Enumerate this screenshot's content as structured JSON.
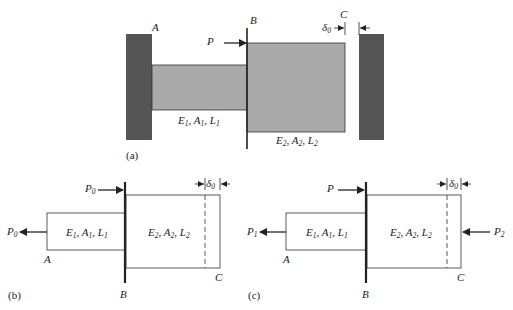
{
  "colors": {
    "wall": "#555555",
    "bar_fill": "#aaaaaa",
    "line": "#222222",
    "background": "#ffffff"
  },
  "panel_a": {
    "label": "(a)",
    "point_A": "A",
    "point_B": "B",
    "point_C": "C",
    "load": "P",
    "gap": "δ",
    "gap_sub": "0",
    "segment1": {
      "E": "E",
      "A": "A",
      "L": "L",
      "sub": "1"
    },
    "segment2": {
      "E": "E",
      "A": "A",
      "L": "L",
      "sub": "2"
    }
  },
  "panel_b": {
    "label": "(b)",
    "point_A": "A",
    "point_B": "B",
    "point_C": "C",
    "load_top": "P",
    "load_top_sub": "0",
    "load_left": "P",
    "load_left_sub": "0",
    "gap": "δ",
    "gap_sub": "0",
    "segment1": {
      "E": "E",
      "A": "A",
      "L": "L",
      "sub": "1"
    },
    "segment2": {
      "E": "E",
      "A": "A",
      "L": "L",
      "sub": "2"
    }
  },
  "panel_c": {
    "label": "(c)",
    "point_A": "A",
    "point_B": "B",
    "point_C": "C",
    "load_top": "P",
    "load_left": "P",
    "load_left_sub": "1",
    "load_right": "P",
    "load_right_sub": "2",
    "gap": "δ",
    "gap_sub": "0",
    "segment1": {
      "E": "E",
      "A": "A",
      "L": "L",
      "sub": "1"
    },
    "segment2": {
      "E": "E",
      "A": "A",
      "L": "L",
      "sub": "2"
    }
  }
}
